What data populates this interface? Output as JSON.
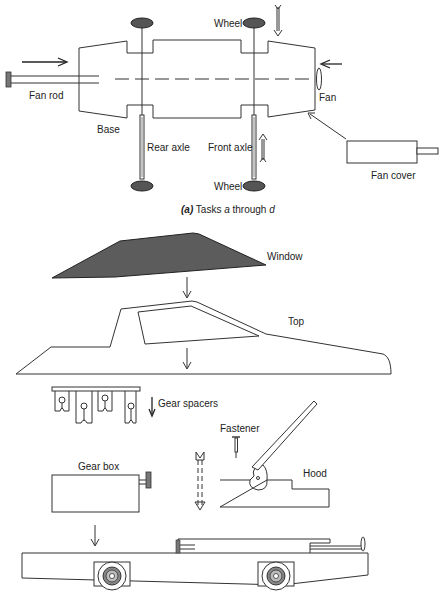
{
  "figure": {
    "caption_part_a": {
      "letter": "(a)",
      "text": " Tasks ",
      "var1": "a",
      "mid": " through ",
      "var2": "d"
    },
    "labels": {
      "fan_rod": "Fan rod",
      "base": "Base",
      "rear_axle": "Rear axle",
      "front_axle": "Front axle",
      "wheel_top": "Wheel",
      "wheel_bottom": "Wheel",
      "fan": "Fan",
      "fan_cover": "Fan cover",
      "window": "Window",
      "top": "Top",
      "gear_spacers": "Gear spacers",
      "fastener": "Fastener",
      "gear_box": "Gear box",
      "hood": "Hood"
    },
    "colors": {
      "line": "#333333",
      "shade": "#5c5c5c",
      "background": "#ffffff"
    }
  }
}
